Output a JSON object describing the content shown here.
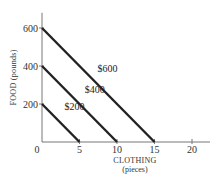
{
  "chart_data": {
    "type": "line",
    "title": "",
    "xlabel": "CLOTHING",
    "xlabel_sub": "(pieces)",
    "ylabel": "FOOD (pounds)",
    "xlim": [
      0,
      22
    ],
    "ylim": [
      0,
      680
    ],
    "x_ticks": [
      0,
      5,
      10,
      15,
      20
    ],
    "x_tick_labels": [
      "0",
      "5",
      "10",
      "15",
      "20"
    ],
    "y_ticks": [
      200,
      400,
      600
    ],
    "y_tick_labels": [
      "200",
      "400",
      "600"
    ],
    "grid": false,
    "legend": "none",
    "series": [
      {
        "name": "$200",
        "label": "$200",
        "x": [
          0,
          5
        ],
        "y": [
          200,
          0
        ]
      },
      {
        "name": "$400",
        "label": "$400",
        "x": [
          0,
          10
        ],
        "y": [
          400,
          0
        ]
      },
      {
        "name": "$600",
        "label": "$600",
        "x": [
          0,
          15
        ],
        "y": [
          600,
          0
        ]
      }
    ],
    "annotations": [
      {
        "text": "$200",
        "series": "$200",
        "at_x": 3.0,
        "at_y": 170
      },
      {
        "text": "$400",
        "series": "$400",
        "at_x": 5.7,
        "at_y": 260
      },
      {
        "text": "$600",
        "series": "$600",
        "at_x": 7.4,
        "at_y": 370
      }
    ],
    "colors": {
      "line": "#222222",
      "axis": "#777777",
      "text": "#333333"
    }
  }
}
